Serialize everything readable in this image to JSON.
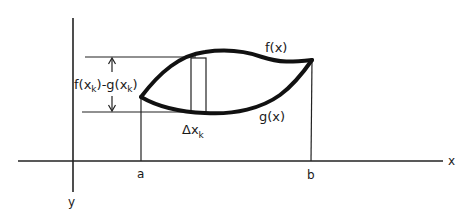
{
  "diagram": {
    "axes": {
      "x_label": "x",
      "y_label": "y"
    },
    "curves": {
      "upper_label": "f(x)",
      "lower_label": "g(x)"
    },
    "bounds": {
      "left_label": "a",
      "right_label": "b"
    },
    "strip": {
      "width_label_main": "Δx",
      "width_label_sub": "k",
      "height_label": {
        "f": "f(x",
        "f_sub": "k",
        "mid": ")-g(x",
        "g_sub": "k",
        "end": ")"
      }
    },
    "colors": {
      "ink": "#111111",
      "background": "#ffffff"
    }
  }
}
